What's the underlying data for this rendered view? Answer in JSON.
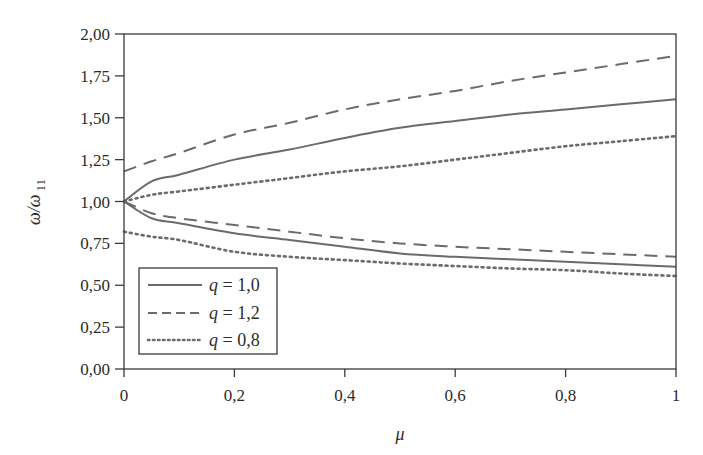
{
  "chart_data": {
    "type": "line",
    "title": "",
    "xlabel": "μ",
    "ylabel": "ω/ω",
    "ylabel_subscript": "11",
    "xlim": [
      0,
      1
    ],
    "ylim": [
      0,
      2
    ],
    "grid": false,
    "legend_position": "lower left (inside)",
    "x_ticks": [
      0,
      0.2,
      0.4,
      0.6,
      0.8,
      1
    ],
    "x_tick_labels": [
      "0",
      "0,2",
      "0,4",
      "0,6",
      "0,8",
      "1"
    ],
    "y_ticks": [
      0,
      0.25,
      0.5,
      0.75,
      1.0,
      1.25,
      1.5,
      1.75,
      2.0
    ],
    "y_tick_labels": [
      "0,00",
      "0,25",
      "0,50",
      "0,75",
      "1,00",
      "1,25",
      "1,50",
      "1,75",
      "2,00"
    ],
    "x": [
      0,
      0.05,
      0.1,
      0.2,
      0.3,
      0.4,
      0.5,
      0.6,
      0.7,
      0.8,
      0.9,
      1.0
    ],
    "series": [
      {
        "name": "q = 1,0 (upper)",
        "legend": "q = 1,0",
        "style": "solid",
        "values": [
          1.0,
          1.12,
          1.16,
          1.25,
          1.31,
          1.38,
          1.44,
          1.48,
          1.52,
          1.55,
          1.58,
          1.61
        ]
      },
      {
        "name": "q = 1,0 (lower)",
        "legend": "q = 1,0",
        "style": "solid",
        "values": [
          1.0,
          0.9,
          0.87,
          0.81,
          0.77,
          0.73,
          0.69,
          0.67,
          0.655,
          0.64,
          0.625,
          0.61
        ]
      },
      {
        "name": "q = 1,2 (upper)",
        "legend": "q = 1,2",
        "style": "dashed",
        "values": [
          1.18,
          1.24,
          1.29,
          1.4,
          1.47,
          1.55,
          1.61,
          1.66,
          1.72,
          1.77,
          1.82,
          1.87
        ]
      },
      {
        "name": "q = 1,2 (lower)",
        "legend": "q = 1,2",
        "style": "dashed",
        "values": [
          1.0,
          0.93,
          0.9,
          0.86,
          0.82,
          0.78,
          0.75,
          0.73,
          0.715,
          0.7,
          0.685,
          0.67
        ]
      },
      {
        "name": "q = 0,8 (upper)",
        "legend": "q = 0,8",
        "style": "dotted",
        "values": [
          1.0,
          1.04,
          1.06,
          1.1,
          1.14,
          1.18,
          1.21,
          1.25,
          1.29,
          1.33,
          1.36,
          1.39
        ]
      },
      {
        "name": "q = 0,8 (lower)",
        "legend": "q = 0,8",
        "style": "dotted",
        "values": [
          0.82,
          0.79,
          0.77,
          0.7,
          0.67,
          0.65,
          0.63,
          0.615,
          0.6,
          0.59,
          0.57,
          0.555
        ]
      }
    ],
    "legend": [
      {
        "q_symbol": "q",
        "rest": " = 1,0",
        "style": "solid"
      },
      {
        "q_symbol": "q",
        "rest": " = 1,2",
        "style": "dashed"
      },
      {
        "q_symbol": "q",
        "rest": " = 0,8",
        "style": "dotted"
      }
    ],
    "colors": {
      "line": "#6b6b6b",
      "axis": "#3a3a3a",
      "text": "#2b2b2b"
    }
  }
}
